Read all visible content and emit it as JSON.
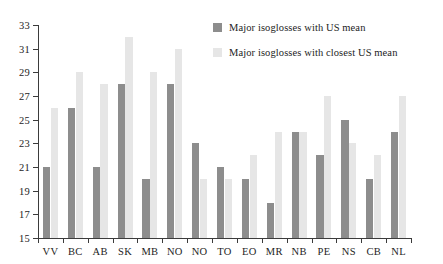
{
  "chart_data": {
    "type": "bar",
    "title": "",
    "xlabel": "",
    "ylabel": "",
    "ylim": [
      15,
      33
    ],
    "yticks": [
      15,
      17,
      19,
      21,
      23,
      25,
      27,
      29,
      31,
      33
    ],
    "grid": false,
    "legend_position": "top-right",
    "categories": [
      "VV",
      "BC",
      "AB",
      "SK",
      "MB",
      "NO",
      "NO",
      "TO",
      "EO",
      "MR",
      "NB",
      "PE",
      "NS",
      "CB",
      "NL"
    ],
    "series": [
      {
        "name": "Major isoglosses with US mean",
        "color": "#8d8d8d",
        "values": [
          21,
          26,
          21,
          28,
          20,
          28,
          23,
          21,
          20,
          18,
          24,
          22,
          25,
          20,
          24
        ]
      },
      {
        "name": "Major isoglosses with closest US mean",
        "color": "#e6e6e6",
        "values": [
          26,
          29,
          28,
          32,
          29,
          31,
          20,
          20,
          22,
          24,
          24,
          27,
          23,
          22,
          27
        ]
      }
    ]
  },
  "legend": {
    "entries": [
      {
        "label": "Major isoglosses with US mean",
        "swatch": "dark"
      },
      {
        "label": "Major isoglosses with closest US mean",
        "swatch": "light"
      }
    ]
  },
  "axis": {
    "y_tick_labels": [
      "33",
      "31",
      "29",
      "27",
      "25",
      "23",
      "21",
      "19",
      "17",
      "15"
    ],
    "x_tick_labels": [
      "VV",
      "BC",
      "AB",
      "SK",
      "MB",
      "NO",
      "NO",
      "TO",
      "EO",
      "MR",
      "NB",
      "PE",
      "NS",
      "CB",
      "NL"
    ]
  }
}
